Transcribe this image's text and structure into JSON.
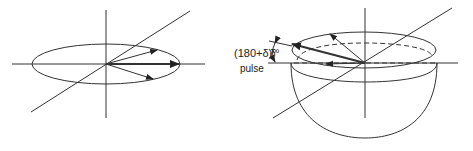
{
  "figure": {
    "left_panel": {
      "description": "Magnetization vectors fanning out in the transverse plane before the pulse",
      "vectors": [
        "upper-spread",
        "central-thick",
        "lower-spread"
      ]
    },
    "pulse_label": {
      "angle": "(180+δ)°",
      "word": "pulse"
    },
    "right_panel": {
      "description": "Vectors tilted by δ out of the transverse plane onto a cone after the pulse",
      "tilt_label": "δ°"
    }
  },
  "colors": {
    "line": "#333333",
    "background": "#ffffff"
  }
}
